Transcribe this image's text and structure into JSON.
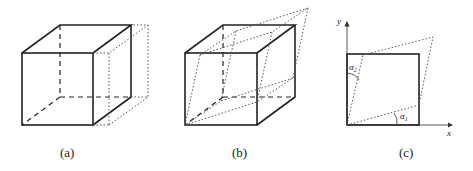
{
  "figure": {
    "panels": [
      {
        "id": "a",
        "caption": "(a)",
        "description": "Cube with dotted simple shear (top face shifted along x)"
      },
      {
        "id": "b",
        "caption": "(b)",
        "description": "Cube with dotted general sheared parallelepiped"
      },
      {
        "id": "c",
        "caption": "(c)",
        "description": "2D square with shear angles"
      }
    ],
    "panel_c": {
      "x_axis_label": "x",
      "y_axis_label": "y",
      "angle1_label": "α",
      "angle1_sub": "1",
      "angle2_label": "α",
      "angle2_sub": "2"
    }
  }
}
